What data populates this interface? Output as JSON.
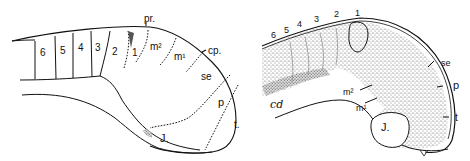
{
  "figure": {
    "left_panel": {
      "segments": [
        "6",
        "5",
        "4",
        "3",
        "2",
        "1"
      ],
      "labels": {
        "pr": "pr.",
        "m2": "m²",
        "m1": "m¹",
        "cp": "cp.",
        "se": "se",
        "p": "p",
        "t": "t.",
        "j": "J."
      }
    },
    "right_panel": {
      "segments": [
        "6",
        "5",
        "4",
        "3",
        "2",
        "1"
      ],
      "labels": {
        "se": "se",
        "p": "p",
        "t": "t",
        "m2": "m²",
        "m1": "m¹",
        "j": "J.",
        "cd": "cd"
      }
    }
  },
  "colors": {
    "ink": "#111111",
    "paper": "#ffffff",
    "stipple": "#555555"
  }
}
